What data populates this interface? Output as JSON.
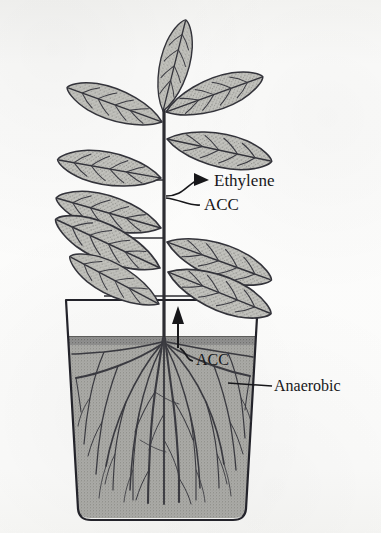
{
  "figure": {
    "name": "plant-waterlogging-ethylene-diagram",
    "clipped_caption": "",
    "background_color": "#fbfbfa",
    "ink_color": "#17171a"
  },
  "labels": {
    "ethylene": "Ethylene",
    "acc_shoot": "ACC",
    "acc_root": "ACC",
    "anaerobic": "Anaerobic"
  },
  "colors": {
    "leaf_fill": "#b9b9b4",
    "leaf_outline": "#35353a",
    "soil_fill": "#a8a8a4",
    "soil_top_band": "#8f8f8b",
    "pot_outline": "#2a2a2e",
    "root_color": "#3a3a40",
    "stem_color": "#2d2d32"
  },
  "structure": {
    "plant_parts": [
      "leaf",
      "stem",
      "petiole",
      "root",
      "pot",
      "soil"
    ],
    "soil_surface_y": 336,
    "pot_bottom_y": 520,
    "pot_left_x": 66,
    "pot_right_x": 258
  }
}
